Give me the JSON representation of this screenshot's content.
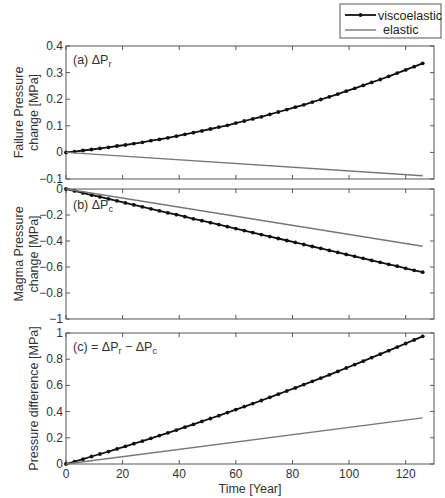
{
  "chart_data": [
    {
      "type": "line",
      "panel": "a",
      "annotation": "(a) ΔP_r",
      "ylabel": [
        "Failure Pressure",
        "change [MPa]"
      ],
      "xlabel": "",
      "xlim": [
        0,
        130
      ],
      "ylim": [
        -0.1,
        0.4
      ],
      "yticks": [
        -0.1,
        0,
        0.1,
        0.2,
        0.3,
        0.4
      ],
      "ytick_labels": [
        "-0.1",
        "0",
        "0.1",
        "0.2",
        "0.3",
        "0.4"
      ],
      "xticks": [
        0,
        20,
        40,
        60,
        80,
        100,
        120
      ],
      "grid": false,
      "series": [
        {
          "name": "viscoelastic",
          "x": [
            0,
            3,
            6,
            9,
            12,
            15,
            18,
            21,
            24,
            27,
            30,
            33,
            36,
            39,
            42,
            45,
            48,
            51,
            54,
            57,
            60,
            63,
            66,
            69,
            72,
            75,
            78,
            81,
            84,
            87,
            90,
            93,
            96,
            99,
            102,
            105,
            108,
            111,
            114,
            117,
            120,
            123,
            126
          ],
          "values": [
            0.0,
            0.003,
            0.007,
            0.011,
            0.015,
            0.019,
            0.024,
            0.028,
            0.033,
            0.038,
            0.044,
            0.049,
            0.055,
            0.061,
            0.068,
            0.074,
            0.081,
            0.088,
            0.095,
            0.102,
            0.11,
            0.118,
            0.126,
            0.134,
            0.143,
            0.152,
            0.161,
            0.17,
            0.179,
            0.189,
            0.199,
            0.209,
            0.219,
            0.23,
            0.241,
            0.252,
            0.263,
            0.274,
            0.286,
            0.298,
            0.31,
            0.322,
            0.335
          ]
        },
        {
          "name": "elastic",
          "x": [
            0,
            126
          ],
          "values": [
            0.0,
            -0.088
          ]
        }
      ]
    },
    {
      "type": "line",
      "panel": "b",
      "annotation": "(b) ΔP_c",
      "ylabel": [
        "Magma Pressure",
        "change [MPa]"
      ],
      "xlabel": "",
      "xlim": [
        0,
        130
      ],
      "ylim": [
        -1,
        0
      ],
      "yticks": [
        -1,
        -0.8,
        -0.6,
        -0.4,
        -0.2,
        0
      ],
      "ytick_labels": [
        "-1",
        "-0.8",
        "-0.6",
        "-0.4",
        "-0.2",
        "0"
      ],
      "xticks": [
        0,
        20,
        40,
        60,
        80,
        100,
        120
      ],
      "grid": false,
      "series": [
        {
          "name": "viscoelastic",
          "x": [
            0,
            3,
            6,
            9,
            12,
            15,
            18,
            21,
            24,
            27,
            30,
            33,
            36,
            39,
            42,
            45,
            48,
            51,
            54,
            57,
            60,
            63,
            66,
            69,
            72,
            75,
            78,
            81,
            84,
            87,
            90,
            93,
            96,
            99,
            102,
            105,
            108,
            111,
            114,
            117,
            120,
            123,
            126
          ],
          "values": [
            0.0,
            -0.015,
            -0.03,
            -0.046,
            -0.061,
            -0.076,
            -0.091,
            -0.107,
            -0.122,
            -0.137,
            -0.152,
            -0.168,
            -0.183,
            -0.198,
            -0.213,
            -0.229,
            -0.244,
            -0.259,
            -0.274,
            -0.29,
            -0.305,
            -0.32,
            -0.335,
            -0.351,
            -0.366,
            -0.381,
            -0.396,
            -0.411,
            -0.427,
            -0.442,
            -0.457,
            -0.472,
            -0.488,
            -0.503,
            -0.518,
            -0.533,
            -0.549,
            -0.564,
            -0.579,
            -0.594,
            -0.61,
            -0.625,
            -0.64
          ]
        },
        {
          "name": "elastic",
          "x": [
            0,
            126
          ],
          "values": [
            0.0,
            -0.44
          ]
        }
      ]
    },
    {
      "type": "line",
      "panel": "c",
      "annotation": "(c) = ΔP_r - ΔP_c",
      "ylabel": [
        "Pressure difference [MPa]"
      ],
      "xlabel": "Time [Year]",
      "xlim": [
        0,
        130
      ],
      "ylim": [
        0,
        1
      ],
      "yticks": [
        0,
        0.2,
        0.4,
        0.6,
        0.8,
        1
      ],
      "ytick_labels": [
        "0",
        "0.2",
        "0.4",
        "0.6",
        "0.8",
        "1"
      ],
      "xticks": [
        0,
        20,
        40,
        60,
        80,
        100,
        120
      ],
      "xtick_labels": [
        "0",
        "20",
        "40",
        "60",
        "80",
        "100",
        "120"
      ],
      "grid": false,
      "series": [
        {
          "name": "viscoelastic",
          "x": [
            0,
            3,
            6,
            9,
            12,
            15,
            18,
            21,
            24,
            27,
            30,
            33,
            36,
            39,
            42,
            45,
            48,
            51,
            54,
            57,
            60,
            63,
            66,
            69,
            72,
            75,
            78,
            81,
            84,
            87,
            90,
            93,
            96,
            99,
            102,
            105,
            108,
            111,
            114,
            117,
            120,
            123,
            126
          ],
          "values": [
            0.0,
            0.018,
            0.037,
            0.057,
            0.076,
            0.095,
            0.115,
            0.135,
            0.155,
            0.175,
            0.196,
            0.217,
            0.238,
            0.259,
            0.281,
            0.303,
            0.325,
            0.347,
            0.369,
            0.392,
            0.415,
            0.438,
            0.461,
            0.485,
            0.509,
            0.533,
            0.557,
            0.581,
            0.606,
            0.631,
            0.656,
            0.681,
            0.707,
            0.733,
            0.759,
            0.785,
            0.812,
            0.838,
            0.865,
            0.892,
            0.92,
            0.947,
            0.975
          ]
        },
        {
          "name": "elastic",
          "x": [
            0,
            126
          ],
          "values": [
            0.0,
            0.352
          ]
        }
      ]
    }
  ],
  "legend": {
    "position": "top-right, outside above panel (a)",
    "entries": [
      {
        "label": "viscoelastic",
        "style": "black line with dot markers"
      },
      {
        "label": "elastic",
        "style": "gray line"
      }
    ]
  },
  "colors": {
    "viscoelastic": "#111111",
    "elastic": "#777777",
    "axes": "#555555"
  }
}
